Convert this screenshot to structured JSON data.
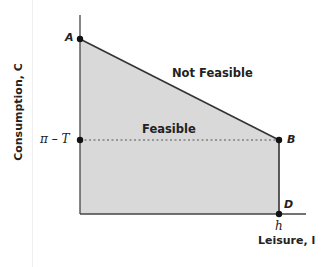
{
  "diagram": {
    "y_axis_label": "Consumption, C",
    "x_axis_label": "Leisure, l",
    "y_tick_label": "π – T",
    "x_tick_label": "h",
    "regions": {
      "infeasible": "Not Feasible",
      "feasible": "Feasible"
    },
    "points": [
      {
        "label": "A",
        "x": 80,
        "y": 39
      },
      {
        "label": "B",
        "x": 279,
        "y": 140
      },
      {
        "label": "D",
        "x": 279,
        "y": 214
      },
      {
        "label": "",
        "x": 80,
        "y": 140
      }
    ],
    "colors": {
      "feasible_fill": "#d9d9d9",
      "line": "#333333"
    }
  }
}
